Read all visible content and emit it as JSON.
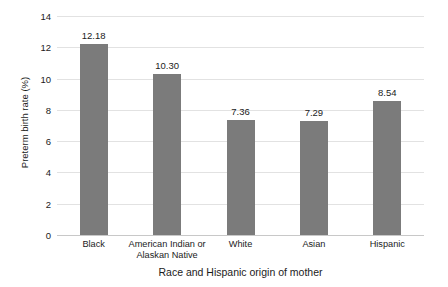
{
  "chart_data": {
    "type": "bar",
    "title": "",
    "subtitle": "",
    "xlabel": "Race and Hispanic origin of mother",
    "ylabel": "Preterm birth rate (%)",
    "categories": [
      "Black",
      "American Indian or Alaskan Native",
      "White",
      "Asian",
      "Hispanic"
    ],
    "category_lines": [
      [
        "Black"
      ],
      [
        "American Indian or",
        "Alaskan Native"
      ],
      [
        "White"
      ],
      [
        "Asian"
      ],
      [
        "Hispanic"
      ]
    ],
    "values": [
      12.18,
      10.3,
      7.36,
      7.29,
      8.54
    ],
    "value_labels": [
      "12.18",
      "10.30",
      "7.36",
      "7.29",
      "8.54"
    ],
    "ylim": [
      0,
      14
    ],
    "yticks": [
      0,
      2,
      4,
      6,
      8,
      10,
      12,
      14
    ],
    "ytick_labels": [
      "0",
      "2",
      "4",
      "6",
      "8",
      "10",
      "12",
      "14"
    ],
    "grid": true,
    "grid_axis": "y",
    "legend": false,
    "legend_position": "none",
    "bar_color": "#7b7b7b",
    "grid_color": "#e2e2e2",
    "axis_color": "#c8c8c8",
    "text_color": "#1b1b1b",
    "background_color": "#ffffff"
  }
}
